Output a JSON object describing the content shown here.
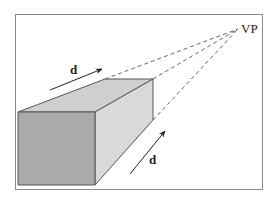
{
  "diagram": {
    "type": "one-point perspective illustration",
    "vanishing_point": {
      "label": "VP"
    },
    "arrows": [
      {
        "label": "d",
        "position": "above top edge of box"
      },
      {
        "label": "d",
        "position": "beside right side of box"
      }
    ],
    "shape": "rectangular box receding toward vanishing point",
    "colors": {
      "front_face": "#aaaaaa",
      "top_face": "#cfcfcf",
      "side_face": "#d9d9d9",
      "edges": "#555555",
      "construction_lines": "#555555",
      "frame": "#8a8a8a"
    }
  }
}
